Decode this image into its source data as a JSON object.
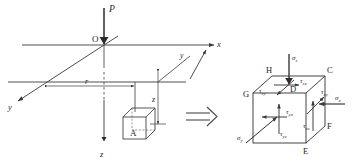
{
  "figure": {
    "background": "#ffffff",
    "line_color": "#3a3a3a",
    "text_color": "#262626"
  },
  "left_diagram": {
    "name": "half-space-point-load",
    "load_label": "P",
    "origin_label": "O",
    "axes": {
      "x_label": "x",
      "y_label": "y",
      "z_label": "z"
    },
    "dimensions": {
      "radial_label": "r",
      "depth_label": "z"
    },
    "element_label": "A"
  },
  "transition": {
    "name": "implies-arrow",
    "glyph": "⟹"
  },
  "right_diagram": {
    "name": "stress-element-cube",
    "vertices": [
      "H",
      "C",
      "G",
      "D",
      "F",
      "E"
    ],
    "vertex_labels": {
      "top_back_left": "H",
      "top_back_right": "C",
      "top_front_left": "G",
      "top_front_right": "D",
      "bottom_right": "F",
      "bottom_front": "E"
    },
    "stresses": {
      "sigma_z": "σ",
      "sigma_z_sub": "z",
      "sigma_x": "σ",
      "sigma_x_sub": "x",
      "sigma_y": "σ",
      "sigma_y_sub": "y",
      "tau_zx": "τ",
      "tau_zx_sub": "zx",
      "tau_zy": "τ",
      "tau_zy_sub": "zy",
      "tau_xy": "τ",
      "tau_xy_sub": "xy",
      "tau_xz": "τ",
      "tau_xz_sub": "xz",
      "tau_yx": "τ",
      "tau_yx_sub": "yx",
      "tau_yz": "τ",
      "tau_yz_sub": "yz"
    }
  }
}
